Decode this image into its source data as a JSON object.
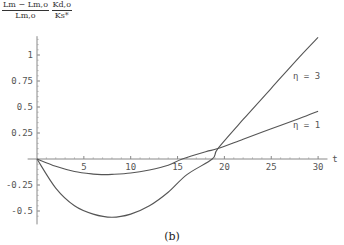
{
  "ylabel": {
    "frac1_num": "Lm − Lm,o",
    "frac1_den": "Lm,o",
    "frac2_num": "Kd,o",
    "frac2_den": "Ks*"
  },
  "caption": "(b)",
  "chart_data": {
    "type": "line",
    "title": "",
    "xlabel": "t",
    "ylabel": "(Lm − Lm,o)/Lm,o · Kd,o/Ks*",
    "xlim": [
      0,
      30
    ],
    "ylim": [
      -0.6,
      1.2
    ],
    "xticks": [
      5,
      10,
      15,
      20,
      25,
      30
    ],
    "yticks": [
      -0.5,
      -0.25,
      0.25,
      0.5,
      0.75,
      1
    ],
    "ytick_labels": [
      "-0.5",
      "-0.25",
      "0.25",
      "0.5",
      "0.75",
      "1"
    ],
    "grid": false,
    "legend": "inline labels",
    "series": [
      {
        "name": "η = 1",
        "x": [
          0,
          2,
          4,
          6,
          7,
          8,
          10,
          12,
          14,
          15.5,
          18,
          19.3,
          22,
          25,
          28,
          30
        ],
        "values": [
          0,
          -0.07,
          -0.12,
          -0.145,
          -0.15,
          -0.148,
          -0.135,
          -0.105,
          -0.06,
          0,
          0.07,
          0.1,
          0.19,
          0.29,
          0.39,
          0.46
        ]
      },
      {
        "name": "η = 3",
        "x": [
          0,
          2,
          4,
          6,
          8,
          10,
          12,
          14,
          16,
          18.7,
          19.3,
          22,
          25,
          28,
          30
        ],
        "values": [
          0,
          -0.28,
          -0.45,
          -0.53,
          -0.56,
          -0.53,
          -0.45,
          -0.32,
          -0.15,
          0,
          0.1,
          0.38,
          0.68,
          0.98,
          1.17
        ]
      }
    ],
    "annotations": [
      "η = 3",
      "η = 1"
    ]
  }
}
